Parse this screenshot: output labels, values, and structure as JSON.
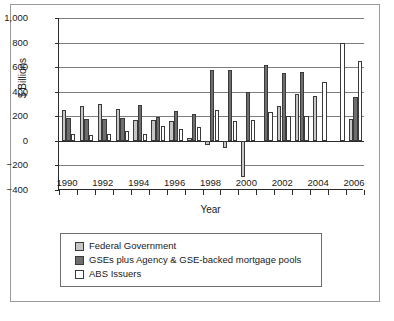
{
  "chart_data": {
    "type": "bar",
    "title": "",
    "xlabel": "Year",
    "ylabel": "$ Billions",
    "ylim": [
      -400,
      1000
    ],
    "yticks": [
      1000,
      800,
      600,
      400,
      200,
      0,
      -200,
      -400
    ],
    "ytick_labels": [
      "1,000",
      "800",
      "600",
      "400",
      "200",
      "0",
      "−200",
      "−400"
    ],
    "grid": true,
    "legend_position": "below-axes",
    "categories": [
      1990,
      1991,
      1992,
      1993,
      1994,
      1995,
      1996,
      1997,
      1998,
      1999,
      2000,
      2001,
      2002,
      2003,
      2004,
      2005,
      2006
    ],
    "xtick_labels": [
      "1990",
      "1992",
      "1994",
      "1996",
      "1998",
      "2000",
      "2002",
      "2004",
      "2006"
    ],
    "series": [
      {
        "name": "Federal Government",
        "color": "#c6c6c6",
        "values": [
          248,
          285,
          297,
          257,
          172,
          172,
          160,
          23,
          -30,
          -55,
          -295,
          0,
          280,
          380,
          365,
          0,
          180
        ]
      },
      {
        "name": "GSEs plus Agency & GSE-backed mortgage pools",
        "color": "#6e6e6e",
        "values": [
          185,
          178,
          178,
          185,
          290,
          192,
          240,
          215,
          575,
          580,
          400,
          615,
          555,
          563,
          0,
          0,
          360
        ]
      },
      {
        "name": "ABS Issuers",
        "color": "#ffffff",
        "values": [
          55,
          45,
          52,
          78,
          55,
          122,
          95,
          115,
          255,
          165,
          168,
          238,
          200,
          200,
          478,
          800,
          650
        ]
      }
    ]
  },
  "legend": {
    "items": [
      {
        "label": "Federal Government",
        "swatch": "fed"
      },
      {
        "label": "GSEs plus Agency & GSE-backed mortgage pools",
        "swatch": "gse"
      },
      {
        "label": "ABS Issuers",
        "swatch": "abs"
      }
    ]
  },
  "caption": {
    "text": ""
  }
}
